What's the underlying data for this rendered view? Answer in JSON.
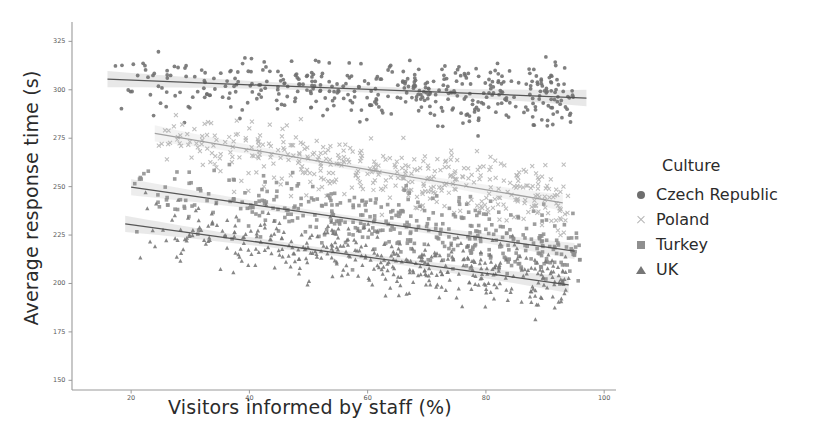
{
  "chart_data": {
    "type": "scatter",
    "title": "",
    "xlabel": "Visitors informed by staff (%)",
    "ylabel": "Average response time (s)",
    "xlim": [
      10,
      102
    ],
    "ylim": [
      145,
      335
    ],
    "xticks": [
      20,
      40,
      60,
      80,
      100
    ],
    "yticks": [
      150,
      175,
      200,
      225,
      250,
      275,
      300,
      325
    ],
    "xtick_labels": [
      "20",
      "40",
      "60",
      "80",
      "100"
    ],
    "ytick_labels": [
      "150",
      "175",
      "200",
      "225",
      "250",
      "275",
      "300",
      "325"
    ],
    "grid": false,
    "legend": {
      "title": "Culture",
      "position": "right",
      "entries": [
        {
          "label": "Czech Republic",
          "marker": "circle",
          "color": "#6e6e6e"
        },
        {
          "label": "Poland",
          "marker": "x",
          "color": "#b6b6b6"
        },
        {
          "label": "Turkey",
          "marker": "square",
          "color": "#8f8f8f"
        },
        {
          "label": "UK",
          "marker": "triangle",
          "color": "#767676"
        }
      ]
    },
    "series": [
      {
        "name": "Czech Republic",
        "marker": "circle",
        "color": "#6e6e6e",
        "n_points": 420,
        "x_range": [
          17,
          95
        ],
        "y_mean_at_x20": 305,
        "y_mean_at_x95": 296,
        "y_scatter_sd": 11,
        "trend": {
          "intercept": 307.4,
          "slope": -0.12,
          "x_start": 16,
          "x_end": 97
        }
      },
      {
        "name": "Poland",
        "marker": "x",
        "color": "#b6b6b6",
        "n_points": 420,
        "x_range": [
          24,
          94
        ],
        "y_mean_at_x25": 277,
        "y_mean_at_x90": 240,
        "y_scatter_sd": 12,
        "trend": {
          "intercept": 290.0,
          "slope": -0.52,
          "x_start": 24,
          "x_end": 93
        }
      },
      {
        "name": "Turkey",
        "marker": "square",
        "color": "#8f8f8f",
        "n_points": 430,
        "x_range": [
          20,
          96
        ],
        "y_mean_at_x20": 250,
        "y_mean_at_x92": 218,
        "y_scatter_sd": 12,
        "trend": {
          "intercept": 258.5,
          "slope": -0.44,
          "x_start": 20,
          "x_end": 95
        }
      },
      {
        "name": "UK",
        "marker": "triangle",
        "color": "#767676",
        "n_points": 430,
        "x_range": [
          19,
          94
        ],
        "y_mean_at_x20": 230,
        "y_mean_at_x90": 200,
        "y_scatter_sd": 12,
        "trend": {
          "intercept": 238.8,
          "slope": -0.42,
          "x_start": 19,
          "x_end": 94
        }
      }
    ]
  },
  "axes": {
    "x_label": "Visitors informed by staff (%)",
    "y_label": "Average response time (s)"
  },
  "legend": {
    "title": "Culture",
    "items": [
      {
        "label": "Czech Republic"
      },
      {
        "label": "Poland"
      },
      {
        "label": "Turkey"
      },
      {
        "label": "UK"
      }
    ]
  },
  "colors": {
    "background": "#ffffff",
    "axis": "#9a9a9a",
    "text": "#2b2b2b",
    "tick_text": "#5a5a5a"
  }
}
